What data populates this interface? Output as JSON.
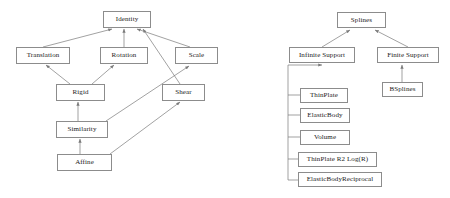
{
  "canvas": {
    "width": 450,
    "height": 198,
    "background": "#ffffff"
  },
  "style": {
    "box_border_color": "#8c8c8c",
    "edge_color": "#7a7a7a",
    "text_color": "#1a1a1a"
  },
  "diagrams": [
    {
      "id": "transformation-hierarchy",
      "nodes": [
        {
          "id": "identity",
          "label": "Identity",
          "x": 103,
          "y": 11,
          "w": 48,
          "h": 17
        },
        {
          "id": "translation",
          "label": "Translation",
          "x": 16,
          "y": 47,
          "w": 54,
          "h": 17
        },
        {
          "id": "rotation",
          "label": "Rotation",
          "x": 100,
          "y": 47,
          "w": 48,
          "h": 17
        },
        {
          "id": "scale",
          "label": "Scale",
          "x": 175,
          "y": 47,
          "w": 43,
          "h": 17
        },
        {
          "id": "rigid",
          "label": "Rigid",
          "x": 56,
          "y": 84,
          "w": 49,
          "h": 17
        },
        {
          "id": "shear",
          "label": "Shear",
          "x": 162,
          "y": 84,
          "w": 43,
          "h": 17
        },
        {
          "id": "similarity",
          "label": "Similarity",
          "x": 56,
          "y": 121,
          "w": 52,
          "h": 17
        },
        {
          "id": "affine",
          "label": "Affine",
          "x": 57,
          "y": 154,
          "w": 55,
          "h": 17
        }
      ],
      "edges": [
        {
          "from": "translation",
          "to": "identity"
        },
        {
          "from": "rotation",
          "to": "identity"
        },
        {
          "from": "scale",
          "to": "identity"
        },
        {
          "from": "shear",
          "to": "identity"
        },
        {
          "from": "rigid",
          "to": "translation"
        },
        {
          "from": "rigid",
          "to": "rotation"
        },
        {
          "from": "similarity",
          "to": "rigid"
        },
        {
          "from": "similarity",
          "to": "scale"
        },
        {
          "from": "affine",
          "to": "similarity"
        },
        {
          "from": "affine",
          "to": "shear"
        }
      ]
    },
    {
      "id": "spline-hierarchy",
      "nodes": [
        {
          "id": "splines",
          "label": "Splines",
          "x": 337,
          "y": 12,
          "w": 49,
          "h": 16
        },
        {
          "id": "infinite-support",
          "label": "Infinite Support",
          "x": 289,
          "y": 47,
          "w": 66,
          "h": 16
        },
        {
          "id": "finite-support",
          "label": "Finite Support",
          "x": 377,
          "y": 47,
          "w": 62,
          "h": 16
        },
        {
          "id": "bsplines",
          "label": "BSplines",
          "x": 382,
          "y": 82,
          "w": 41,
          "h": 15
        },
        {
          "id": "thinplate",
          "label": "ThinPlate",
          "x": 300,
          "y": 88,
          "w": 48,
          "h": 15
        },
        {
          "id": "elasticbody",
          "label": "ElasticBody",
          "x": 300,
          "y": 108,
          "w": 50,
          "h": 15
        },
        {
          "id": "volume",
          "label": "Volume",
          "x": 300,
          "y": 130,
          "w": 50,
          "h": 15
        },
        {
          "id": "thinplate-r2-logr",
          "label": "ThinPlate R2 Log(R)",
          "x": 298,
          "y": 152,
          "w": 79,
          "h": 15
        },
        {
          "id": "elasticbodyreciprocal",
          "label": "ElasticBodyReciprocal",
          "x": 298,
          "y": 172,
          "w": 84,
          "h": 15
        }
      ],
      "edges": [
        {
          "from": "infinite-support",
          "to": "splines"
        },
        {
          "from": "finite-support",
          "to": "splines"
        },
        {
          "from": "bsplines",
          "to": "finite-support"
        },
        {
          "from": "thinplate",
          "to": "infinite-support"
        },
        {
          "from": "elasticbody",
          "to": "infinite-support"
        },
        {
          "from": "volume",
          "to": "infinite-support"
        },
        {
          "from": "thinplate-r2-logr",
          "to": "infinite-support"
        },
        {
          "from": "elasticbodyreciprocal",
          "to": "infinite-support"
        }
      ]
    }
  ]
}
